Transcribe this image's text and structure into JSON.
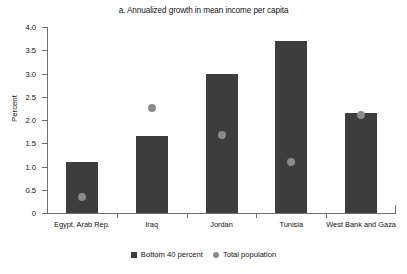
{
  "chart_data": {
    "type": "bar",
    "title": "a. Annualized growth in mean income per capita",
    "xlabel": "",
    "ylabel": "Percent",
    "ylim": [
      0,
      4.0
    ],
    "yticks": [
      "0",
      "0.5",
      "1.0",
      "1.5",
      "2.0",
      "2.5",
      "3.0",
      "3.5",
      "4.0"
    ],
    "grid": false,
    "legend_position": "bottom-center",
    "categories": [
      "Egypt, Arab Rep.",
      "Iraq",
      "Jordan",
      "Tunisia",
      "West Bank and Gaza"
    ],
    "series": [
      {
        "name": "Bottom 40 percent",
        "marker": "square",
        "color": "#3d3d3d",
        "values": [
          1.1,
          1.65,
          3.0,
          3.7,
          2.15
        ]
      },
      {
        "name": "Total population",
        "marker": "circle",
        "color": "#8a8a8a",
        "values": [
          0.35,
          2.25,
          1.68,
          1.1,
          2.1
        ]
      }
    ]
  },
  "legend": {
    "items": [
      {
        "label": "Bottom 40 percent"
      },
      {
        "label": "Total population"
      }
    ]
  },
  "colors": {
    "bar": "#3d3d3d",
    "dot": "#8a8a8a",
    "axis": "#6f6f6f",
    "text": "#111111",
    "background": "#ffffff"
  }
}
